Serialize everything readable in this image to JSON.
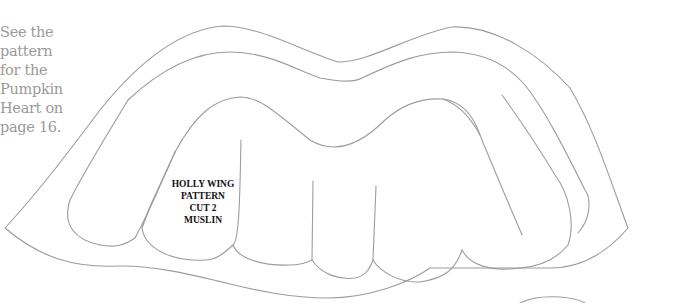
{
  "side_note": {
    "lines": [
      "See the",
      "pattern",
      "for the",
      "Pumpkin",
      "Heart on",
      "page 16."
    ]
  },
  "pattern": {
    "label_lines": [
      "HOLLY WING",
      "PATTERN",
      "CUT 2",
      "MUSLIN"
    ],
    "stroke_color": "#9c9c9c",
    "label_color": "#111111"
  }
}
